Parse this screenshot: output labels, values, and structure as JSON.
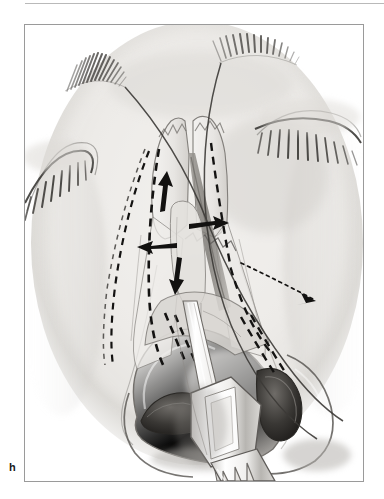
{
  "figure": {
    "panel_letter": "h",
    "caption_visible": false,
    "illustration_title": "Frontal view of face during rhinoplasty osteotomy",
    "top_rule_color": "#b9b9b9",
    "frame_border_color": "#9a9a9a",
    "background_color": "#ffffff",
    "ink_color": "#1a1a1a",
    "skin_light": "#f2f1ef",
    "skin_mid": "#dedcd9",
    "skin_shadow": "#b9b6b2",
    "bone_fill": "#eceae7",
    "gap_shadow": "#8e8b87",
    "instrument_light": "#fbfbfb",
    "instrument_shadow": "#c5c3c0"
  },
  "anatomy": {
    "parts": [
      {
        "name": "left-eyebrow",
        "label": "Left eyebrow (medial)"
      },
      {
        "name": "right-eyebrow",
        "label": "Right eyebrow (medial)"
      },
      {
        "name": "left-closed-eye",
        "label": "Left closed eye with lashes"
      },
      {
        "name": "right-closed-eye",
        "label": "Right closed eye with lashes"
      },
      {
        "name": "nasal-dorsum",
        "label": "Nasal dorsum"
      },
      {
        "name": "nasal-bone-left",
        "label": "Left nasal bone"
      },
      {
        "name": "nasal-bone-right",
        "label": "Right nasal bone"
      },
      {
        "name": "nasal-tip",
        "label": "Nasal tip"
      },
      {
        "name": "left-nostril",
        "label": "Left nostril (alar rim)"
      },
      {
        "name": "right-nostril",
        "label": "Right nostril (alar rim)"
      },
      {
        "name": "osteotomy-gap",
        "label": "Osteotomy gap / shaded bone edge"
      }
    ]
  },
  "annotations": {
    "dashed_osteotomy_lines": [
      {
        "name": "lateral-osteotomy-left",
        "style": "dashed",
        "side": "left"
      },
      {
        "name": "lateral-osteotomy-right",
        "style": "dashed",
        "side": "right"
      },
      {
        "name": "medial-osteotomy-left",
        "style": "dashed",
        "side": "left"
      },
      {
        "name": "medial-osteotomy-right",
        "style": "dashed",
        "side": "right"
      }
    ],
    "arrows": [
      {
        "name": "arrow-superior-medial",
        "direction": "up",
        "meaning": "superior infracture vector"
      },
      {
        "name": "arrow-lateral-left",
        "direction": "left",
        "meaning": "left segment outfracture"
      },
      {
        "name": "arrow-medial-right",
        "direction": "right",
        "meaning": "right segment infracture"
      },
      {
        "name": "arrow-inferior",
        "direction": "down",
        "meaning": "inferior displacement vector"
      },
      {
        "name": "arrow-dotted-lateral-right",
        "direction": "down-right",
        "meaning": "lateral osteotomy path"
      }
    ]
  },
  "instrument": {
    "name": "osteotome",
    "label": "Guarded osteotome in left nostril",
    "entry": "left nasal vestibule"
  }
}
